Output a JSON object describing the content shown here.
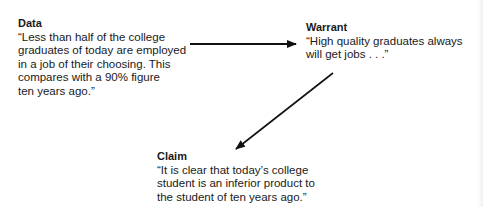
{
  "diagram": {
    "type": "toulmin-argument",
    "nodes": {
      "data": {
        "heading": "Data",
        "text": "“Less than half of the college\ngraduates of today are employed\nin a job of their choosing. This\ncompares with a 90% figure\nten years ago.”"
      },
      "warrant": {
        "heading": "Warrant",
        "text": "“High quality graduates always\nwill get jobs . . .”"
      },
      "claim": {
        "heading": "Claim",
        "text": "“It is clear that today’s college\nstudent is an inferior product to\nthe student of ten years ago.”"
      }
    },
    "edges": [
      {
        "from": "data",
        "to": "warrant",
        "direction": "right"
      },
      {
        "from": "warrant",
        "to": "claim",
        "direction": "down-left"
      }
    ],
    "colors": {
      "text": "#1a1a1a",
      "arrow": "#111111",
      "background": "#ffffff"
    }
  }
}
